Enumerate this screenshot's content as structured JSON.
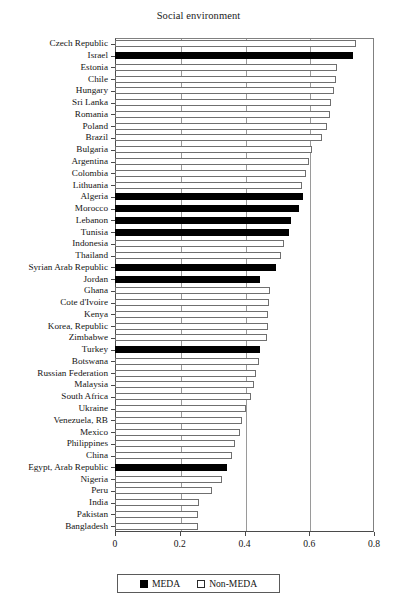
{
  "chart_data": {
    "type": "bar",
    "orientation": "horizontal",
    "title": "Social environment",
    "xlabel": "",
    "ylabel": "",
    "xlim": [
      0,
      0.8
    ],
    "xticks": [
      0,
      0.2,
      0.4,
      0.6,
      0.8
    ],
    "xtick_labels": [
      "0",
      "0.2",
      "0.4",
      "0.6",
      "0.8"
    ],
    "grid": "vertical",
    "legend_position": "bottom-center",
    "legend": [
      {
        "label": "MEDA",
        "color": "#000000",
        "fill": "solid"
      },
      {
        "label": "Non-MEDA",
        "color": "#ffffff",
        "fill": "hollow"
      }
    ],
    "categories": [
      "Czech Republic",
      "Israel",
      "Estonia",
      "Chile",
      "Hungary",
      "Sri Lanka",
      "Romania",
      "Poland",
      "Brazil",
      "Bulgaria",
      "Argentina",
      "Colombia",
      "Lithuania",
      "Algeria",
      "Morocco",
      "Lebanon",
      "Tunisia",
      "Indonesia",
      "Thailand",
      "Syrian Arab Republic",
      "Jordan",
      "Ghana",
      "Cote d'Ivoire",
      "Kenya",
      "Korea, Republic",
      "Zimbabwe",
      "Turkey",
      "Botswana",
      "Russian Federation",
      "Malaysia",
      "South Africa",
      "Ukraine",
      "Venezuela, RB",
      "Mexico",
      "Philippines",
      "China",
      "Egypt, Arab Republic",
      "Nigeria",
      "Peru",
      "India",
      "Pakistan",
      "Bangladesh"
    ],
    "values": [
      0.744,
      0.735,
      0.685,
      0.683,
      0.675,
      0.668,
      0.663,
      0.655,
      0.64,
      0.608,
      0.6,
      0.59,
      0.578,
      0.58,
      0.568,
      0.545,
      0.537,
      0.522,
      0.513,
      0.497,
      0.447,
      0.478,
      0.476,
      0.474,
      0.472,
      0.47,
      0.448,
      0.445,
      0.437,
      0.428,
      0.42,
      0.405,
      0.392,
      0.385,
      0.37,
      0.362,
      0.347,
      0.33,
      0.3,
      0.258,
      0.257,
      0.257
    ],
    "groups": [
      "Non-MEDA",
      "MEDA",
      "Non-MEDA",
      "Non-MEDA",
      "Non-MEDA",
      "Non-MEDA",
      "Non-MEDA",
      "Non-MEDA",
      "Non-MEDA",
      "Non-MEDA",
      "Non-MEDA",
      "Non-MEDA",
      "Non-MEDA",
      "MEDA",
      "MEDA",
      "MEDA",
      "MEDA",
      "Non-MEDA",
      "Non-MEDA",
      "MEDA",
      "MEDA",
      "Non-MEDA",
      "Non-MEDA",
      "Non-MEDA",
      "Non-MEDA",
      "Non-MEDA",
      "MEDA",
      "Non-MEDA",
      "Non-MEDA",
      "Non-MEDA",
      "Non-MEDA",
      "Non-MEDA",
      "Non-MEDA",
      "Non-MEDA",
      "Non-MEDA",
      "Non-MEDA",
      "MEDA",
      "Non-MEDA",
      "Non-MEDA",
      "Non-MEDA",
      "Non-MEDA",
      "Non-MEDA"
    ]
  }
}
